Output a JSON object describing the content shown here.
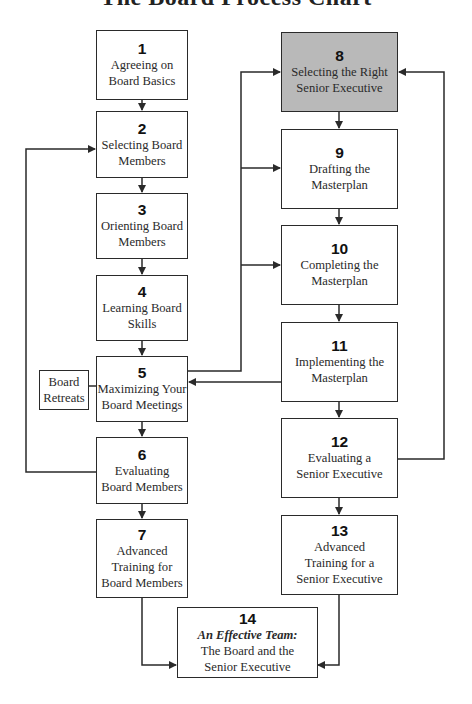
{
  "title": "The Board Process Chart",
  "colors": {
    "line": "#2a2a2a",
    "highlight_fill": "#b9b9b9",
    "box_fill": "#ffffff"
  },
  "steps": [
    {
      "num": "1",
      "label_lines": [
        "Agreeing on",
        "Board Basics"
      ]
    },
    {
      "num": "2",
      "label_lines": [
        "Selecting Board",
        "Members"
      ]
    },
    {
      "num": "3",
      "label_lines": [
        "Orienting Board",
        "Members"
      ]
    },
    {
      "num": "4",
      "label_lines": [
        "Learning Board",
        "Skills"
      ]
    },
    {
      "num": "5",
      "label_lines": [
        "Maximizing Your",
        "Board Meetings"
      ]
    },
    {
      "num": "6",
      "label_lines": [
        "Evaluating",
        "Board Members"
      ]
    },
    {
      "num": "7",
      "label_lines": [
        "Advanced",
        "Training for",
        "Board Members"
      ]
    },
    {
      "num": "8",
      "label_lines": [
        "Selecting the Right",
        "Senior Executive"
      ],
      "highlighted": true
    },
    {
      "num": "9",
      "label_lines": [
        "Drafting the",
        "Masterplan"
      ]
    },
    {
      "num": "10",
      "label_lines": [
        "Completing the",
        "Masterplan"
      ]
    },
    {
      "num": "11",
      "label_lines": [
        "Implementing the",
        "Masterplan"
      ]
    },
    {
      "num": "12",
      "label_lines": [
        "Evaluating a",
        "Senior Executive"
      ]
    },
    {
      "num": "13",
      "label_lines": [
        "Advanced",
        "Training for a",
        "Senior Executive"
      ]
    },
    {
      "num": "14",
      "label_emphasis": "An Effective Team:",
      "label_lines": [
        "The Board and the",
        "Senior Executive"
      ]
    }
  ],
  "side_note": {
    "label_lines": [
      "Board",
      "Retreats"
    ]
  }
}
